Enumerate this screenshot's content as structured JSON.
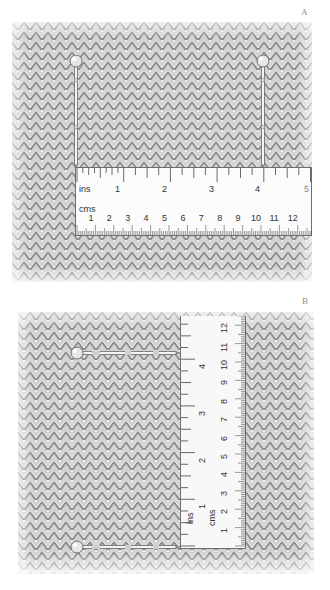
{
  "figure": {
    "panels": [
      {
        "label": "A",
        "orientation": "horizontal",
        "ruler": {
          "inch_unit_label": "ins",
          "cm_unit_label": "cms",
          "inch_numbers": [
            "1",
            "2",
            "3",
            "4",
            "5"
          ],
          "cm_numbers": [
            "1",
            "2",
            "3",
            "4",
            "5",
            "6",
            "7",
            "8",
            "9",
            "10",
            "11",
            "12"
          ]
        },
        "pins": [
          {
            "name": "left-pin",
            "position_in": 0
          },
          {
            "name": "right-pin",
            "position_in": 4
          }
        ]
      },
      {
        "label": "B",
        "orientation": "vertical",
        "ruler": {
          "inch_unit_label": "ins",
          "cm_unit_label": "cms",
          "inch_numbers": [
            "1",
            "2",
            "3",
            "4"
          ],
          "cm_numbers": [
            "1",
            "2",
            "3",
            "4",
            "5",
            "6",
            "7",
            "8",
            "9",
            "10",
            "11",
            "12"
          ]
        },
        "pins": [
          {
            "name": "bottom-pin",
            "position_in": 0
          },
          {
            "name": "top-pin",
            "position_in": 4
          }
        ]
      }
    ],
    "colors": {
      "fabric_base": "#c9c9c9",
      "fabric_stitch_dark": "#8e8e8e",
      "fabric_highlight": "#ffffff",
      "ruler_face": "#fbfbfb",
      "ruler_ink": "#3a3a3a",
      "pin_head": "#e4e4e4"
    }
  }
}
